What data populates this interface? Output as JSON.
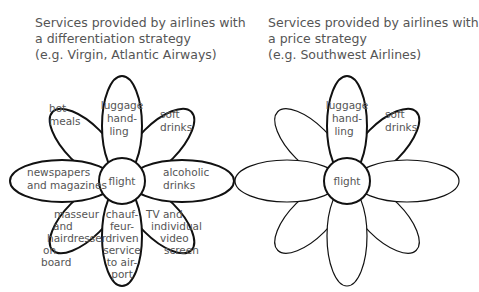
{
  "left": {
    "title": [
      "Services provided by airlines with",
      "a differentiation strategy",
      "(e.g. Virgin, Atlantic Airways)"
    ],
    "center": "flight",
    "petals": {
      "top": [
        "luggage",
        "hand-",
        "ling"
      ],
      "top_right": [
        "soft",
        "drinks"
      ],
      "right": [
        "alcoholic",
        "drinks"
      ],
      "bottom_right": [
        "TV and",
        "individual",
        "video",
        "screen"
      ],
      "bottom": [
        "chauf-",
        "feur-",
        "driven",
        "service",
        "to air-",
        "port"
      ],
      "bottom_left": [
        "masseur",
        "and",
        "hairdresser",
        "on",
        "board"
      ],
      "left": [
        "newspapers",
        "and magazines"
      ],
      "top_left": [
        "hot",
        "meals"
      ]
    }
  },
  "right": {
    "title": [
      "Services provided by airlines with",
      "a price strategy",
      "(e.g. Southwest Airlines)"
    ],
    "center": "flight",
    "petals": {
      "top": [
        "luggage",
        "hand-",
        "ling"
      ],
      "top_right": [
        "soft",
        "drinks"
      ]
    }
  }
}
